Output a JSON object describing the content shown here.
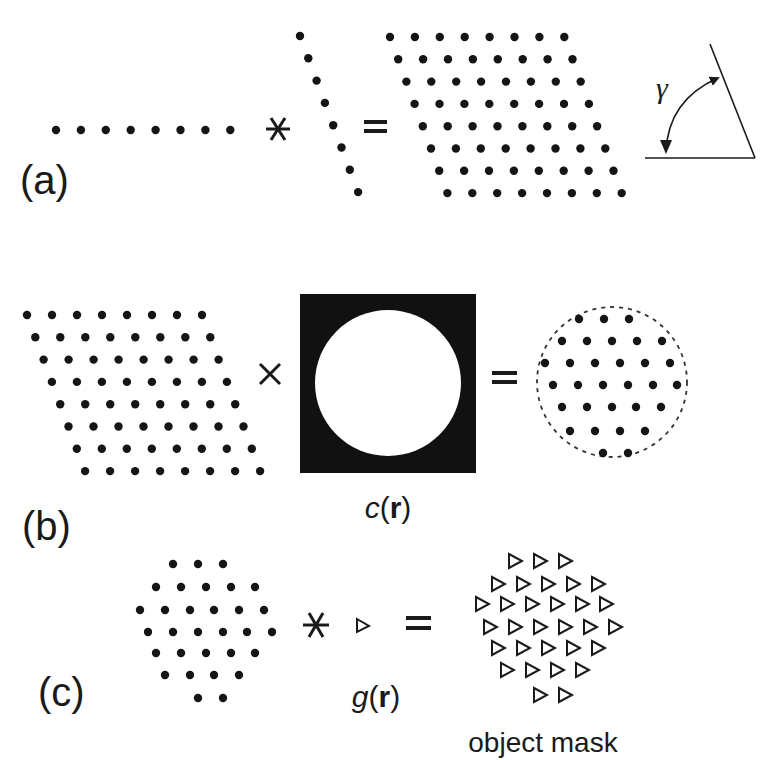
{
  "panels": {
    "a": {
      "label": "(a)",
      "operator1": "*",
      "operator2": "=",
      "angle_symbol": "γ",
      "row_lattice": {
        "count": 8,
        "x0": 56,
        "y": 130,
        "dx": 24.9
      },
      "slanted_lattice": {
        "count": 8,
        "x0": 300,
        "y0": 36,
        "dx": 8.3,
        "dy": 22.3
      },
      "result_lattice": {
        "rows": 8,
        "cols": 8,
        "x0": 390,
        "y0": 37,
        "dx": 24.9,
        "row_shift": 8.2,
        "dy": 22.3
      }
    },
    "b": {
      "label": "(b)",
      "operator1": "×",
      "operator2": "=",
      "aperture_label_italic": "c",
      "aperture_label_bold": "r",
      "lattice": {
        "rows": 8,
        "cols": 8,
        "x0": 27,
        "y0": 315,
        "dx": 25,
        "row_shift": 8.3,
        "dy": 22.3
      },
      "aperture": {
        "x": 300,
        "y": 294,
        "w": 176,
        "h": 179,
        "cx": 388,
        "cy": 383,
        "r": 73
      },
      "result": {
        "cx": 611,
        "cy": 382,
        "r": 75
      }
    },
    "c": {
      "label": "(c)",
      "operator1": "*",
      "operator2": "=",
      "kernel_label_italic": "g",
      "kernel_label_bold": "r",
      "result_label": "object mask"
    }
  },
  "hex_rows_b_result": [
    {
      "y": 319,
      "xs": [
        579,
        604,
        629
      ]
    },
    {
      "y": 341,
      "xs": [
        562,
        587,
        612,
        637,
        662
      ]
    },
    {
      "y": 363,
      "xs": [
        545,
        570,
        595,
        620,
        645,
        670
      ]
    },
    {
      "y": 385,
      "xs": [
        553,
        578,
        603,
        628,
        653,
        677
      ]
    },
    {
      "y": 407,
      "xs": [
        562,
        587,
        612,
        636,
        661
      ]
    },
    {
      "y": 431,
      "xs": [
        570,
        595,
        620,
        645
      ]
    },
    {
      "y": 453,
      "xs": [
        603,
        628
      ]
    }
  ],
  "hex_rows_c": [
    {
      "y": 564,
      "xs": [
        173,
        198,
        223
      ]
    },
    {
      "y": 587,
      "xs": [
        156,
        181,
        206,
        231,
        255
      ]
    },
    {
      "y": 610,
      "xs": [
        140,
        165,
        190,
        214,
        239,
        264
      ]
    },
    {
      "y": 632,
      "xs": [
        148,
        173,
        198,
        223,
        247,
        272
      ]
    },
    {
      "y": 653,
      "xs": [
        156,
        181,
        206,
        231,
        255
      ]
    },
    {
      "y": 675,
      "xs": [
        165,
        190,
        214,
        239
      ]
    },
    {
      "y": 698,
      "xs": [
        198,
        223
      ]
    }
  ],
  "tri_rows_c": [
    {
      "y": 561,
      "xs": [
        515,
        540,
        565
      ]
    },
    {
      "y": 584,
      "xs": [
        498,
        523,
        548,
        573,
        598
      ]
    },
    {
      "y": 604,
      "xs": [
        482,
        507,
        532,
        557,
        582,
        606
      ]
    },
    {
      "y": 627,
      "xs": [
        490,
        515,
        540,
        565,
        590,
        615
      ]
    },
    {
      "y": 648,
      "xs": [
        498,
        523,
        548,
        573,
        598
      ]
    },
    {
      "y": 670,
      "xs": [
        507,
        532,
        557,
        582
      ]
    },
    {
      "y": 695,
      "xs": [
        540,
        565
      ]
    }
  ]
}
